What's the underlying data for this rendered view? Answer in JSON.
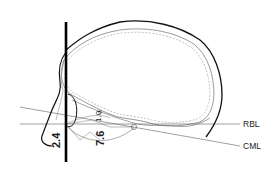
{
  "diagram": {
    "type": "anatomical-line-drawing",
    "colors": {
      "background": "#ffffff",
      "outline": "#111111",
      "inner_contour": "#6e6e6e",
      "reference_line": "#777777"
    },
    "reference_lines": [
      {
        "id": "rbl",
        "label": "RBL"
      },
      {
        "id": "cml",
        "label": "CML"
      }
    ],
    "measurements": [
      {
        "id": "m1",
        "value": "2.4"
      },
      {
        "id": "m2",
        "value": "7.6"
      },
      {
        "id": "m3",
        "value": "1.0"
      }
    ],
    "vertical_reference": {
      "description": "thick vertical line through face"
    }
  }
}
